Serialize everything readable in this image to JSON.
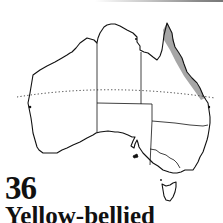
{
  "map": {
    "subject": "Australia distribution map",
    "range_region": "north-east Queensland coast",
    "range_color": "#a6a6a6",
    "outline_color": "#111111",
    "line_style_tropic": "dotted"
  },
  "caption": {
    "number": "36",
    "name": "Yellow-bellied"
  }
}
